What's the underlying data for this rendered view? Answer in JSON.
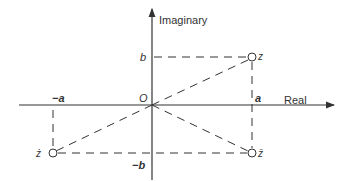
{
  "diagram": {
    "axes": {
      "real_label": "Real",
      "imaginary_label": "Imaginary",
      "origin_label": "O"
    },
    "ticks": {
      "a": "a",
      "neg_a": "−a",
      "b": "b",
      "neg_b": "−b"
    },
    "points": {
      "z": {
        "label": "z",
        "coords": "(a, b)"
      },
      "z_bar": {
        "label": "z̄",
        "coords": "(a, −b)"
      },
      "neg_z": {
        "label": "ż",
        "coords": "(−a, −b)"
      }
    },
    "colors": {
      "line": "#333333",
      "background": "#ffffff"
    }
  }
}
